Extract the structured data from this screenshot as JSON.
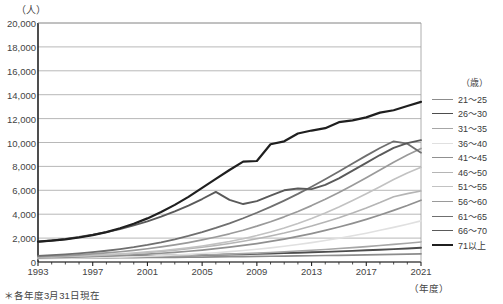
{
  "axis": {
    "y_unit": "（人）",
    "x_unit": "（年度）",
    "y_ticks": [
      "20,000",
      "18,000",
      "16,000",
      "14,000",
      "12,000",
      "10,000",
      "8,000",
      "6,000",
      "4,000",
      "2,000",
      "0"
    ],
    "x_ticks": [
      "1993",
      "1997",
      "2001",
      "2005",
      "2009",
      "2013",
      "2017",
      "2021"
    ]
  },
  "legend": {
    "header": "（歳）",
    "items": [
      {
        "label": "21～25",
        "color": "#8c8c8c",
        "width": 1.7
      },
      {
        "label": "26～30",
        "color": "#4d4d4d",
        "width": 1.9
      },
      {
        "label": "31～35",
        "color": "#a6a6a6",
        "width": 1.6
      },
      {
        "label": "36～40",
        "color": "#e0e0e0",
        "width": 1.6
      },
      {
        "label": "41～45",
        "color": "#909090",
        "width": 1.7
      },
      {
        "label": "46～50",
        "color": "#b5b5b5",
        "width": 1.6
      },
      {
        "label": "51～55",
        "color": "#c2c2c2",
        "width": 1.6
      },
      {
        "label": "56～60",
        "color": "#9a9a9a",
        "width": 1.7
      },
      {
        "label": "61～65",
        "color": "#6f6f6f",
        "width": 1.8
      },
      {
        "label": "66～70",
        "color": "#5a5a5a",
        "width": 1.9
      },
      {
        "label": "71以上",
        "color": "#1f1f1f",
        "width": 2.2
      }
    ]
  },
  "footnote": "＊各年度3月31日現在",
  "chart_data": {
    "type": "line",
    "title": "",
    "xlabel": "（年度）",
    "ylabel": "（人）",
    "ylim": [
      0,
      20000
    ],
    "xlim": [
      1993,
      2021
    ],
    "grid": true,
    "legend_position": "right",
    "x": [
      1993,
      1994,
      1995,
      1996,
      1997,
      1998,
      1999,
      2000,
      2001,
      2002,
      2003,
      2004,
      2005,
      2006,
      2007,
      2008,
      2009,
      2010,
      2011,
      2012,
      2013,
      2014,
      2015,
      2016,
      2017,
      2018,
      2019,
      2020,
      2021
    ],
    "series": [
      {
        "name": "21～25",
        "color": "#8c8c8c",
        "values": [
          330,
          330,
          335,
          340,
          345,
          350,
          360,
          365,
          375,
          385,
          395,
          405,
          415,
          425,
          440,
          450,
          465,
          480,
          495,
          510,
          525,
          545,
          560,
          580,
          600,
          620,
          640,
          660,
          680
        ]
      },
      {
        "name": "26～30",
        "color": "#4d4d4d",
        "values": [
          420,
          425,
          430,
          440,
          450,
          460,
          475,
          490,
          505,
          520,
          540,
          560,
          580,
          600,
          625,
          650,
          680,
          710,
          740,
          775,
          810,
          850,
          890,
          935,
          980,
          1030,
          1080,
          1130,
          1190
        ]
      },
      {
        "name": "31～35",
        "color": "#a6a6a6",
        "values": [
          330,
          340,
          350,
          365,
          380,
          395,
          415,
          435,
          460,
          485,
          515,
          545,
          580,
          615,
          655,
          700,
          745,
          800,
          855,
          915,
          980,
          1050,
          1125,
          1205,
          1290,
          1380,
          1475,
          1570,
          1680
        ]
      },
      {
        "name": "36～40",
        "color": "#e0e0e0",
        "values": [
          280,
          295,
          310,
          330,
          355,
          380,
          410,
          445,
          485,
          530,
          580,
          640,
          705,
          780,
          865,
          960,
          1065,
          1185,
          1315,
          1460,
          1620,
          1795,
          1985,
          2190,
          2410,
          2650,
          2900,
          3160,
          3440
        ]
      },
      {
        "name": "41～45",
        "color": "#909090",
        "values": [
          350,
          370,
          395,
          425,
          460,
          500,
          545,
          600,
          660,
          730,
          810,
          900,
          1000,
          1115,
          1240,
          1385,
          1545,
          1725,
          1920,
          2140,
          2380,
          2640,
          2925,
          3235,
          3570,
          3930,
          4320,
          4730,
          5170
        ]
      },
      {
        "name": "46～50",
        "color": "#b5b5b5",
        "values": [
          400,
          425,
          455,
          490,
          535,
          585,
          645,
          715,
          795,
          885,
          990,
          1105,
          1235,
          1385,
          1550,
          1735,
          1940,
          2170,
          2420,
          2700,
          3005,
          3340,
          3700,
          4095,
          4520,
          4975,
          5460,
          5720,
          5940
        ]
      },
      {
        "name": "51～55",
        "color": "#c2c2c2",
        "values": [
          420,
          445,
          475,
          515,
          560,
          615,
          680,
          755,
          845,
          945,
          1060,
          1190,
          1345,
          1520,
          1720,
          1950,
          2210,
          2510,
          2845,
          3220,
          3640,
          4100,
          4600,
          5140,
          5710,
          6300,
          6900,
          7450,
          7930
        ]
      },
      {
        "name": "56～60",
        "color": "#9a9a9a",
        "values": [
          450,
          490,
          540,
          600,
          675,
          760,
          860,
          975,
          1110,
          1260,
          1430,
          1625,
          1845,
          2090,
          2360,
          2660,
          3000,
          3370,
          3780,
          4230,
          4720,
          5250,
          5820,
          6420,
          7050,
          7700,
          8350,
          8950,
          9500
        ]
      },
      {
        "name": "61～65",
        "color": "#6f6f6f",
        "values": [
          520,
          575,
          640,
          720,
          820,
          940,
          1080,
          1240,
          1430,
          1650,
          1900,
          2180,
          2500,
          2850,
          3240,
          3660,
          4120,
          4610,
          5140,
          5700,
          6300,
          6930,
          7580,
          8240,
          8900,
          9540,
          10100,
          9900,
          9150
        ]
      },
      {
        "name": "66～70",
        "color": "#5a5a5a",
        "values": [
          1700,
          1800,
          1930,
          2090,
          2280,
          2500,
          2760,
          3060,
          3400,
          3790,
          4230,
          4720,
          5270,
          5870,
          5200,
          4850,
          5100,
          5550,
          6000,
          6150,
          6100,
          6450,
          7000,
          7650,
          8300,
          8950,
          9550,
          9950,
          10200
        ]
      },
      {
        "name": "71以上",
        "color": "#1f1f1f",
        "values": [
          1700,
          1790,
          1900,
          2050,
          2250,
          2500,
          2820,
          3200,
          3650,
          4180,
          4780,
          5450,
          6200,
          6950,
          7700,
          8400,
          8450,
          9850,
          10100,
          10750,
          11000,
          11200,
          11700,
          11850,
          12100,
          12500,
          12700,
          13050,
          13400
        ]
      }
    ]
  }
}
